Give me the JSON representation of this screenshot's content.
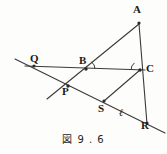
{
  "figure": {
    "caption": "図 9 . 6",
    "stroke_color": "#3a3a3a",
    "label_color": "#1a1a1a",
    "background": "#fdfdfc",
    "width": 167,
    "height": 154
  },
  "points": [
    {
      "id": "A",
      "label": "A",
      "x": 139,
      "y": 22,
      "label_x": 135,
      "label_y": 8
    },
    {
      "id": "Q",
      "label": "Q",
      "x": 34,
      "y": 66,
      "label_x": 33,
      "label_y": 55
    },
    {
      "id": "B",
      "label": "B",
      "x": 86,
      "y": 69,
      "label_x": 80,
      "label_y": 57
    },
    {
      "id": "C",
      "label": "C",
      "x": 140,
      "y": 70,
      "label_x": 146,
      "label_y": 64
    },
    {
      "id": "P",
      "label": "P",
      "x": 68,
      "y": 86,
      "label_x": 64,
      "label_y": 87
    },
    {
      "id": "S",
      "label": "S",
      "x": 104,
      "y": 101,
      "label_x": 99,
      "label_y": 104
    },
    {
      "id": "R",
      "label": "R",
      "x": 147,
      "y": 122,
      "label_x": 142,
      "label_y": 122
    }
  ],
  "lines": [
    {
      "id": "line-ell",
      "name": "transversal-line-ell",
      "x1": 15,
      "y1": 59,
      "x2": 165,
      "y2": 133
    },
    {
      "id": "line-QC",
      "name": "horizontal-line-Q-C",
      "x1": 25,
      "y1": 66,
      "x2": 145,
      "y2": 70
    },
    {
      "id": "line-AB-ext",
      "name": "line-A-through-B-to-P-lower-left",
      "x1": 139,
      "y1": 24,
      "x2": 47,
      "y2": 99
    },
    {
      "id": "line-AR",
      "name": "line-A-to-R",
      "x1": 139,
      "y1": 24,
      "x2": 147,
      "y2": 124
    },
    {
      "id": "line-PS",
      "name": "segment-P-to-S-on-ell",
      "x1": 68,
      "y1": 86,
      "x2": 104,
      "y2": 101
    },
    {
      "id": "line-SC",
      "name": "segment-S-to-C",
      "x1": 104,
      "y1": 101,
      "x2": 140,
      "y2": 70
    },
    {
      "id": "line-BP",
      "name": "segment-B-to-P",
      "x1": 86,
      "y1": 69,
      "x2": 68,
      "y2": 86
    }
  ],
  "line_labels": [
    {
      "id": "ell",
      "label": "ℓ",
      "x": 121,
      "y": 110
    }
  ],
  "angle_marks": [
    {
      "id": "angle-at-B",
      "vertex": "B",
      "cx": 86,
      "cy": 69,
      "radius": 9,
      "start_deg": 180,
      "end_deg": 219
    },
    {
      "id": "angle-at-C",
      "vertex": "C",
      "cx": 140,
      "cy": 70,
      "radius": 9,
      "start_deg": 180,
      "end_deg": 220
    }
  ]
}
